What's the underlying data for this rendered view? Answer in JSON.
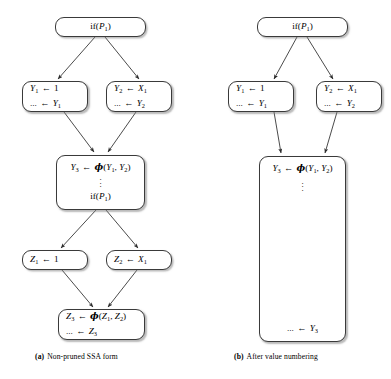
{
  "figure": {
    "panels": [
      {
        "id": "panel-a",
        "caption_label": "(a)",
        "caption_text": "Non-pruned SSA form",
        "nodes": [
          {
            "id": "a-if-top",
            "lines": [
              "if(P1)"
            ]
          },
          {
            "id": "a-y1",
            "lines": [
              "Y1 ← 1",
              "... ← Y1"
            ]
          },
          {
            "id": "a-y2",
            "lines": [
              "Y2 ← X1",
              "... ← Y2"
            ]
          },
          {
            "id": "a-y3",
            "lines": [
              "Y3 ← ϕ(Y1, Y2)",
              "⋮",
              "if(P1)"
            ]
          },
          {
            "id": "a-z1",
            "lines": [
              "Z1 ← 1"
            ]
          },
          {
            "id": "a-z2",
            "lines": [
              "Z2 ← X1"
            ]
          },
          {
            "id": "a-z3",
            "lines": [
              "Z3 ← ϕ(Z1, Z2)",
              "... ← Z3"
            ]
          }
        ],
        "edges": [
          {
            "from": "a-if-top",
            "to": "a-y1"
          },
          {
            "from": "a-if-top",
            "to": "a-y2"
          },
          {
            "from": "a-y1",
            "to": "a-y3"
          },
          {
            "from": "a-y2",
            "to": "a-y3"
          },
          {
            "from": "a-y3",
            "to": "a-z1"
          },
          {
            "from": "a-y3",
            "to": "a-z2"
          },
          {
            "from": "a-z1",
            "to": "a-z3"
          },
          {
            "from": "a-z2",
            "to": "a-z3"
          }
        ]
      },
      {
        "id": "panel-b",
        "caption_label": "(b)",
        "caption_text": "After value numbering",
        "nodes": [
          {
            "id": "b-if-top",
            "lines": [
              "if(P1)"
            ]
          },
          {
            "id": "b-y1",
            "lines": [
              "Y1 ← 1",
              "... ← Y1"
            ]
          },
          {
            "id": "b-y2",
            "lines": [
              "Y2 ← X1",
              "... ← Y2"
            ]
          },
          {
            "id": "b-y3",
            "lines": [
              "Y3 ← ϕ(Y1, Y2)",
              "⋮",
              "... ← Y3"
            ]
          }
        ],
        "edges": [
          {
            "from": "b-if-top",
            "to": "b-y1"
          },
          {
            "from": "b-if-top",
            "to": "b-y2"
          },
          {
            "from": "b-y1",
            "to": "b-y3"
          },
          {
            "from": "b-y2",
            "to": "b-y3"
          }
        ]
      }
    ],
    "colors": {
      "node_border": "#3a3a3a",
      "node_fill": "#ffffff",
      "edge": "#2b2b2b",
      "text": "#000000",
      "background": "#ffffff"
    }
  }
}
